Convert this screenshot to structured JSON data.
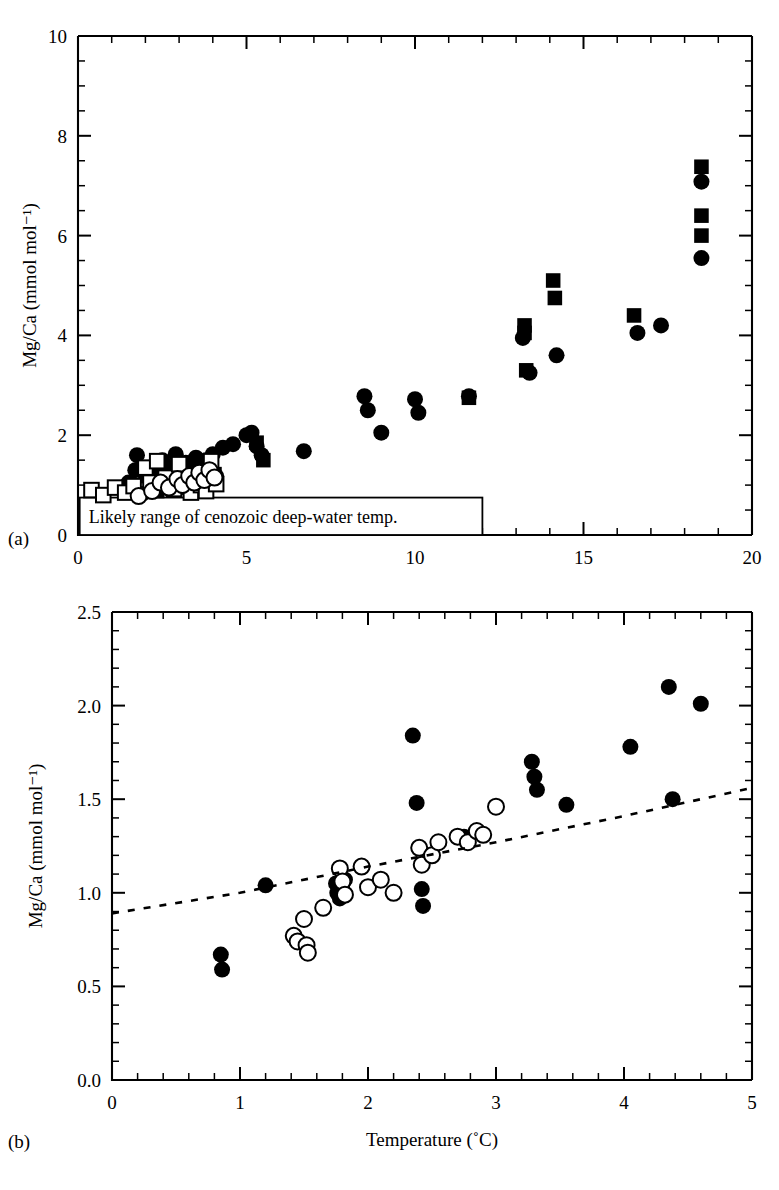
{
  "figure": {
    "panel_a_label": "(a)",
    "panel_b_label": "(b)"
  },
  "chart_data": [
    {
      "id": "panel-a",
      "type": "scatter",
      "title": "",
      "xlabel": "",
      "ylabel": "Mg/Ca (mmol mol⁻¹)",
      "xlim": [
        0,
        20
      ],
      "ylim": [
        0,
        10
      ],
      "xticks": [
        0,
        5,
        10,
        15,
        20
      ],
      "xtick_labels": [
        "0",
        "5",
        "10",
        "15",
        "20"
      ],
      "yticks": [
        0,
        2,
        4,
        6,
        8,
        10
      ],
      "ytick_labels": [
        "0",
        "2",
        "4",
        "6",
        "8",
        "10"
      ],
      "x_minor_step": 1,
      "y_minor_step": 0.5,
      "grid": false,
      "legend": "none",
      "annotations": [
        {
          "text": "Likely range of cenozoic deep-water temp.",
          "x_range": [
            0.05,
            12.0
          ],
          "y_range": [
            0.0,
            0.75
          ],
          "boxed": true
        }
      ],
      "series": [
        {
          "name": "filled-circle",
          "marker": "filled-circle",
          "points": [
            [
              1.5,
              1.05
            ],
            [
              1.7,
              1.3
            ],
            [
              1.75,
              1.6
            ],
            [
              1.9,
              0.82
            ],
            [
              2.2,
              1.0
            ],
            [
              2.3,
              1.25
            ],
            [
              2.45,
              1.1
            ],
            [
              2.5,
              1.5
            ],
            [
              2.6,
              0.95
            ],
            [
              2.7,
              1.35
            ],
            [
              2.8,
              1.2
            ],
            [
              2.9,
              1.62
            ],
            [
              3.0,
              1.05
            ],
            [
              3.1,
              1.3
            ],
            [
              3.2,
              1.45
            ],
            [
              3.3,
              1.15
            ],
            [
              3.4,
              1.0
            ],
            [
              3.5,
              1.55
            ],
            [
              3.55,
              1.28
            ],
            [
              3.7,
              1.2
            ],
            [
              3.8,
              1.5
            ],
            [
              3.9,
              1.35
            ],
            [
              4.0,
              1.62
            ],
            [
              4.1,
              1.18
            ],
            [
              4.3,
              1.75
            ],
            [
              4.6,
              1.82
            ],
            [
              5.0,
              2.0
            ],
            [
              5.15,
              2.05
            ],
            [
              5.3,
              1.78
            ],
            [
              5.45,
              1.6
            ],
            [
              6.7,
              1.68
            ],
            [
              8.5,
              2.78
            ],
            [
              8.6,
              2.5
            ],
            [
              9.0,
              2.05
            ],
            [
              10.0,
              2.72
            ],
            [
              10.1,
              2.45
            ],
            [
              11.6,
              2.78
            ],
            [
              13.2,
              3.95
            ],
            [
              13.4,
              3.25
            ],
            [
              14.2,
              3.6
            ],
            [
              16.6,
              4.05
            ],
            [
              17.3,
              4.2
            ],
            [
              18.5,
              7.08
            ],
            [
              18.5,
              5.55
            ]
          ]
        },
        {
          "name": "filled-square",
          "marker": "filled-square",
          "points": [
            [
              2.0,
              1.18
            ],
            [
              2.35,
              0.88
            ],
            [
              2.55,
              1.12
            ],
            [
              2.75,
              1.0
            ],
            [
              3.05,
              1.2
            ],
            [
              3.25,
              0.95
            ],
            [
              3.45,
              1.08
            ],
            [
              3.6,
              1.38
            ],
            [
              3.9,
              1.08
            ],
            [
              4.05,
              1.22
            ],
            [
              5.3,
              1.85
            ],
            [
              5.5,
              1.5
            ],
            [
              11.6,
              2.75
            ],
            [
              13.25,
              4.2
            ],
            [
              13.25,
              4.05
            ],
            [
              13.3,
              3.3
            ],
            [
              14.1,
              5.1
            ],
            [
              14.15,
              4.75
            ],
            [
              16.5,
              4.4
            ],
            [
              18.5,
              7.38
            ],
            [
              18.5,
              6.4
            ],
            [
              18.5,
              6.0
            ]
          ]
        },
        {
          "name": "open-square",
          "marker": "open-square",
          "points": [
            [
              0.4,
              0.9
            ],
            [
              0.75,
              0.8
            ],
            [
              1.1,
              0.95
            ],
            [
              1.4,
              0.85
            ],
            [
              1.65,
              0.98
            ],
            [
              2.0,
              1.35
            ],
            [
              2.15,
              1.05
            ],
            [
              2.35,
              1.48
            ],
            [
              2.6,
              1.15
            ],
            [
              2.85,
              0.92
            ],
            [
              3.0,
              1.42
            ],
            [
              3.15,
              1.08
            ],
            [
              3.35,
              0.85
            ],
            [
              3.5,
              1.2
            ],
            [
              3.65,
              1.0
            ],
            [
              3.8,
              0.88
            ],
            [
              3.95,
              1.48
            ],
            [
              4.1,
              1.02
            ]
          ]
        },
        {
          "name": "open-circle",
          "marker": "open-circle",
          "points": [
            [
              1.8,
              0.78
            ],
            [
              2.2,
              0.88
            ],
            [
              2.45,
              1.05
            ],
            [
              2.7,
              0.95
            ],
            [
              2.95,
              1.12
            ],
            [
              3.1,
              1.0
            ],
            [
              3.3,
              1.18
            ],
            [
              3.45,
              1.05
            ],
            [
              3.6,
              1.25
            ],
            [
              3.75,
              1.1
            ],
            [
              3.9,
              1.3
            ],
            [
              4.05,
              1.15
            ]
          ]
        }
      ]
    },
    {
      "id": "panel-b",
      "type": "scatter",
      "title": "",
      "xlabel": "Temperature (˚C)",
      "ylabel": "Mg/Ca (mmol mol⁻¹)",
      "xlim": [
        0,
        5
      ],
      "ylim": [
        0.0,
        2.5
      ],
      "xticks": [
        0,
        1,
        2,
        3,
        4,
        5
      ],
      "xtick_labels": [
        "0",
        "1",
        "2",
        "3",
        "4",
        "5"
      ],
      "yticks": [
        0.0,
        0.5,
        1.0,
        1.5,
        2.0,
        2.5
      ],
      "ytick_labels": [
        "0.0",
        "0.5",
        "1.0",
        "1.5",
        "2.0",
        "2.5"
      ],
      "x_minor_step": 0.2,
      "y_minor_step": 0.1,
      "grid": false,
      "legend": "none",
      "series": [
        {
          "name": "filled-circle",
          "marker": "filled-circle",
          "points": [
            [
              0.85,
              0.67
            ],
            [
              0.86,
              0.59
            ],
            [
              1.2,
              1.04
            ],
            [
              1.75,
              1.05
            ],
            [
              1.76,
              1.0
            ],
            [
              1.78,
              0.97
            ],
            [
              1.8,
              1.02
            ],
            [
              1.82,
              1.07
            ],
            [
              2.35,
              1.84
            ],
            [
              2.38,
              1.48
            ],
            [
              2.42,
              1.02
            ],
            [
              2.43,
              0.93
            ],
            [
              2.75,
              1.3
            ],
            [
              3.28,
              1.7
            ],
            [
              3.3,
              1.62
            ],
            [
              3.32,
              1.55
            ],
            [
              3.55,
              1.47
            ],
            [
              4.05,
              1.78
            ],
            [
              4.35,
              2.1
            ],
            [
              4.38,
              1.5
            ],
            [
              4.6,
              2.01
            ]
          ]
        },
        {
          "name": "open-circle",
          "marker": "open-circle",
          "points": [
            [
              1.42,
              0.77
            ],
            [
              1.45,
              0.74
            ],
            [
              1.5,
              0.86
            ],
            [
              1.52,
              0.72
            ],
            [
              1.53,
              0.68
            ],
            [
              1.65,
              0.92
            ],
            [
              1.78,
              1.13
            ],
            [
              1.8,
              1.06
            ],
            [
              1.82,
              0.99
            ],
            [
              1.95,
              1.14
            ],
            [
              2.0,
              1.03
            ],
            [
              2.1,
              1.07
            ],
            [
              2.2,
              1.0
            ],
            [
              2.4,
              1.24
            ],
            [
              2.42,
              1.15
            ],
            [
              2.5,
              1.2
            ],
            [
              2.55,
              1.27
            ],
            [
              2.7,
              1.3
            ],
            [
              2.78,
              1.27
            ],
            [
              2.85,
              1.33
            ],
            [
              2.9,
              1.31
            ],
            [
              3.0,
              1.46
            ]
          ]
        },
        {
          "name": "trend",
          "marker": "dotted-line",
          "points": [
            [
              0.0,
              0.89
            ],
            [
              1.0,
              1.0
            ],
            [
              2.0,
              1.14
            ],
            [
              3.0,
              1.27
            ],
            [
              4.0,
              1.41
            ],
            [
              5.0,
              1.56
            ]
          ]
        }
      ]
    }
  ]
}
